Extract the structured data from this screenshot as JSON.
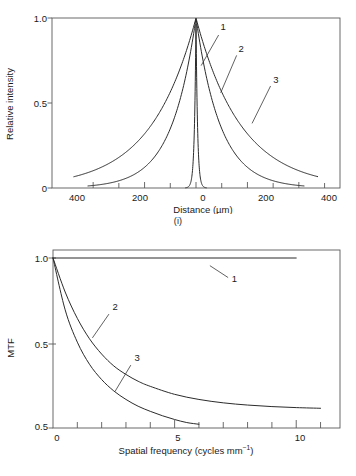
{
  "figure": {
    "panels": [
      {
        "id": "i",
        "caption": "(i)",
        "chart_index": 0
      },
      {
        "id": "ii",
        "caption": "(ii)",
        "chart_index": 1
      }
    ],
    "line_color": "#2b2b2b",
    "axis_color": "#5a5a5a",
    "background": "#ffffff"
  },
  "chart_data": [
    {
      "type": "line",
      "title": "",
      "panel_caption": "(i)",
      "xlabel": "Distance (µm)",
      "ylabel": "Relative intensity",
      "xlim": [
        -560,
        560
      ],
      "ylim": [
        0,
        1.0
      ],
      "grid": false,
      "legend": "inline-curve-labels",
      "x_ticks": [
        -400,
        -300,
        -200,
        -100,
        0,
        100,
        200,
        300,
        400,
        500
      ],
      "x_tick_labels": [
        "400",
        "",
        "200",
        "",
        "0",
        "",
        "200",
        "",
        "400",
        ""
      ],
      "x_major_ticks": [
        -400,
        -200,
        0,
        200,
        400
      ],
      "y_ticks": [
        0,
        0.5,
        1.0
      ],
      "y_tick_labels": [
        "0",
        "0.5",
        "1.0"
      ],
      "series": [
        {
          "name": "1",
          "label": "1",
          "description": "very narrow spike at zero distance",
          "model": "exponential",
          "halfwidth_um": 6,
          "peak": 1.0,
          "label_xy": [
            95,
            0.93
          ],
          "leader_from": [
            88,
            0.9
          ],
          "leader_to": [
            20,
            0.72
          ]
        },
        {
          "name": "2",
          "label": "2",
          "description": "intermediate width peak",
          "model": "exponential",
          "halfwidth_um": 95,
          "peak": 1.0,
          "label_xy": [
            165,
            0.8
          ],
          "leader_from": [
            158,
            0.78
          ],
          "leader_to": [
            96,
            0.56
          ]
        },
        {
          "name": "3",
          "label": "3",
          "description": "broadest peak",
          "model": "exponential",
          "halfwidth_um": 175,
          "peak": 1.0,
          "label_xy": [
            300,
            0.62
          ],
          "leader_from": [
            290,
            0.6
          ],
          "leader_to": [
            218,
            0.38
          ]
        }
      ]
    },
    {
      "type": "line",
      "title": "",
      "panel_caption": "(ii)",
      "xlabel": "Spatial frequency (cycles mm",
      "xlabel_exponent": "−1",
      "xlabel_suffix": ")",
      "ylabel": "MTF",
      "xlim": [
        0,
        11.8
      ],
      "ylim": [
        0,
        1.0
      ],
      "grid": false,
      "legend": "inline-curve-labels",
      "x_ticks": [
        0,
        1,
        2,
        3,
        4,
        5,
        6,
        7,
        8,
        9,
        10,
        11
      ],
      "x_major_ticks": [
        0,
        5,
        10
      ],
      "x_tick_labels": [
        "0",
        "5",
        "10"
      ],
      "y_ticks": [
        0,
        0.5,
        1.0
      ],
      "y_tick_labels": [
        "0.5",
        "0.5",
        "1.0"
      ],
      "y_tick_label_bottom": "0.5",
      "y_tick_label_mid": "0.5",
      "y_tick_label_top": "1.0",
      "series": [
        {
          "name": "1",
          "label": "1",
          "description": "flat response at MTF = 1.0",
          "values_x": [
            0,
            10
          ],
          "values_y": [
            1.0,
            1.0
          ],
          "label_xy": [
            7.35,
            0.86
          ],
          "leader_from": [
            7.2,
            0.885
          ],
          "leader_to": [
            6.45,
            0.955
          ]
        },
        {
          "name": "2",
          "label": "2",
          "description": "slower decay, reaches baseline near 8",
          "values_x": [
            0,
            0.5,
            1.0,
            1.5,
            2.0,
            2.5,
            3.0,
            3.5,
            4.0,
            5.0,
            6.0,
            7.0,
            8.0,
            9.0,
            10.0,
            11.0
          ],
          "values_y": [
            1.0,
            0.8,
            0.645,
            0.525,
            0.435,
            0.365,
            0.315,
            0.275,
            0.245,
            0.198,
            0.168,
            0.148,
            0.135,
            0.126,
            0.12,
            0.116
          ],
          "label_xy": [
            2.45,
            0.695
          ],
          "leader_from": [
            2.3,
            0.67
          ],
          "leader_to": [
            1.62,
            0.53
          ]
        },
        {
          "name": "3",
          "label": "3",
          "description": "faster decay, reaches baseline near 5",
          "values_x": [
            0,
            0.5,
            1.0,
            1.5,
            2.0,
            2.5,
            3.0,
            3.5,
            4.0,
            4.5,
            5.0,
            5.5,
            6.0
          ],
          "values_y": [
            1.0,
            0.695,
            0.505,
            0.375,
            0.285,
            0.218,
            0.168,
            0.128,
            0.098,
            0.072,
            0.05,
            0.032,
            0.022
          ],
          "label_xy": [
            3.35,
            0.395
          ],
          "leader_from": [
            3.2,
            0.37
          ],
          "leader_to": [
            2.55,
            0.215
          ]
        }
      ]
    }
  ]
}
